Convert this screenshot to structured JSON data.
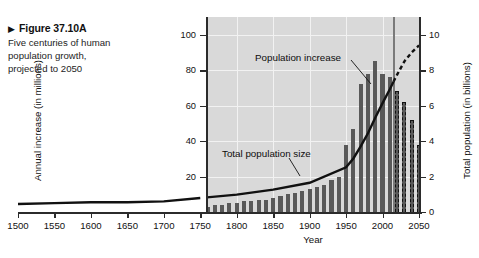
{
  "caption": {
    "marker": "▶",
    "title": "Figure 37.10A",
    "text": "Five centuries of human population growth, projected to 2050"
  },
  "chart_data": {
    "type": "bar",
    "title": "",
    "subtitle": "",
    "xlabel": "Year",
    "ylabel": "Annual increase (in millions)",
    "ylabel_right": "Total population (in billions)",
    "xlim": [
      1500,
      2050
    ],
    "xticks": [
      1500,
      1550,
      1600,
      1650,
      1700,
      1750,
      1800,
      1850,
      1900,
      1950,
      2000,
      2050
    ],
    "ylim_left": [
      0,
      110
    ],
    "yticks_left": [
      20,
      40,
      60,
      80,
      100
    ],
    "ylim_right": [
      0,
      11
    ],
    "yticks_right": [
      0,
      2,
      4,
      6,
      8,
      10
    ],
    "grid": true,
    "legend_position": "none",
    "plot_background": "#d9d9d9",
    "gridline_color": "#f2f2f2",
    "bar_color": "#595959",
    "line_color": "#111111",
    "present_day_marker_year": 2015,
    "annotations": [
      {
        "text": "Population increase",
        "target": "bars"
      },
      {
        "text": "Total population size",
        "target": "line"
      }
    ],
    "series": [
      {
        "name": "Population increase",
        "unit": "millions per year",
        "type": "bar",
        "x": [
          1750,
          1760,
          1770,
          1780,
          1790,
          1800,
          1810,
          1820,
          1830,
          1840,
          1850,
          1860,
          1870,
          1880,
          1890,
          1900,
          1910,
          1920,
          1930,
          1940,
          1950,
          1960,
          1970,
          1980,
          1990,
          2000,
          2010,
          2020,
          2030,
          2040,
          2050
        ],
        "values": [
          3,
          3,
          4,
          4,
          5,
          5,
          6,
          6,
          7,
          7,
          8,
          9,
          10,
          11,
          12,
          13,
          14,
          15,
          18,
          20,
          38,
          47,
          72,
          78,
          85,
          78,
          76,
          68,
          62,
          52,
          38
        ],
        "projected_from": 2015
      },
      {
        "name": "Total population size",
        "unit": "billions",
        "type": "line",
        "x": [
          1500,
          1550,
          1600,
          1650,
          1700,
          1750,
          1800,
          1850,
          1900,
          1950,
          1960,
          1970,
          1980,
          1990,
          2000,
          2010,
          2015,
          2020,
          2030,
          2040,
          2050
        ],
        "values": [
          0.45,
          0.5,
          0.55,
          0.55,
          0.6,
          0.79,
          0.98,
          1.26,
          1.65,
          2.52,
          3.02,
          3.7,
          4.44,
          5.32,
          6.14,
          6.92,
          7.35,
          7.75,
          8.5,
          9.0,
          9.4
        ],
        "projected_from": 2015
      }
    ]
  }
}
